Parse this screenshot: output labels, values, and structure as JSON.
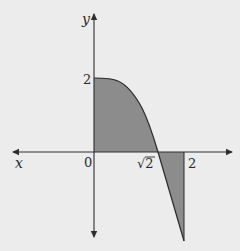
{
  "diagram": {
    "axes": {
      "x_label": "x",
      "y_label": "y",
      "origin_label": "0"
    },
    "ticks": {
      "y_tick_label": "2",
      "x_tick_sqrt2_label": "√2",
      "x_tick_2_label": "2"
    },
    "regions": [
      {
        "name": "positive-region",
        "description": "shaded area between curve and x-axis from x=0 to x=√2",
        "fill": "#8c8c8c"
      },
      {
        "name": "negative-region",
        "description": "shaded area between curve and x-axis from x=√2 to x=2",
        "fill": "#8c8c8c"
      }
    ],
    "colors": {
      "background": "#ececec",
      "axis": "#2e2e2e",
      "shade": "#8c8c8c",
      "curve": "#2a2a2a"
    }
  }
}
